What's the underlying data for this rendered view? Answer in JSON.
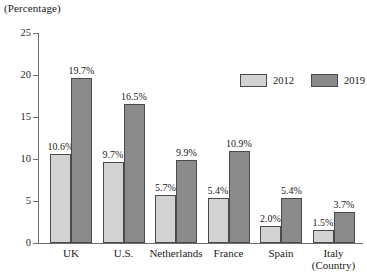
{
  "chart_data": {
    "type": "bar",
    "title": "",
    "ylabel": "(Percentage)",
    "xlabel": "(Country)",
    "ylim": [
      0,
      25
    ],
    "yticks": [
      0,
      5,
      10,
      15,
      20,
      25
    ],
    "grid": false,
    "legend_position": "top-right",
    "categories": [
      "UK",
      "U.S.",
      "Netherlands",
      "France",
      "Spain",
      "Italy"
    ],
    "series": [
      {
        "name": "2012",
        "color": "#d2d2d2",
        "values": [
          10.6,
          9.7,
          5.7,
          5.4,
          2.0,
          1.5
        ],
        "labels": [
          "10.6%",
          "9.7%",
          "5.7%",
          "5.4%",
          "2.0%",
          "1.5%"
        ]
      },
      {
        "name": "2019",
        "color": "#8b8b8b",
        "values": [
          19.7,
          16.5,
          9.9,
          10.9,
          5.4,
          3.7
        ],
        "labels": [
          "19.7%",
          "16.5%",
          "9.9%",
          "10.9%",
          "5.4%",
          "3.7%"
        ]
      }
    ]
  },
  "axis": {
    "y_unit_caption": "(Percentage)",
    "x_unit_caption": "(Country)",
    "tick_labels": [
      "25",
      "20",
      "15",
      "10",
      "5",
      "0"
    ]
  },
  "legend": {
    "items": [
      {
        "label": "2012",
        "color": "#d2d2d2"
      },
      {
        "label": "2019",
        "color": "#8b8b8b"
      }
    ]
  }
}
